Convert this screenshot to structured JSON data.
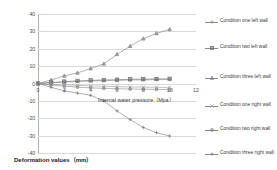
{
  "chart_data": {
    "type": "line",
    "title": "",
    "xlabel": "Internal water pressure（Mpa）",
    "ylabel": "Deformation values（mm）",
    "xlim": [
      0,
      12
    ],
    "ylim": [
      -40,
      40
    ],
    "xticks": [
      "0",
      "2",
      "4",
      "6",
      "8",
      "10",
      "12"
    ],
    "yticks": [
      "40",
      "30",
      "20",
      "10",
      "0",
      "-10",
      "-20",
      "-30",
      "-40"
    ],
    "grid": true,
    "legend_position": "right",
    "x": [
      0,
      1,
      2,
      3,
      4,
      5,
      6,
      7,
      8,
      9,
      10
    ],
    "series": [
      {
        "name": "Condition one left wall",
        "marker": "cross",
        "color": "#8a8a8a",
        "values": [
          0.0,
          0.4,
          0.8,
          1.1,
          1.4,
          1.6,
          1.8,
          2.0,
          2.1,
          2.2,
          2.3
        ]
      },
      {
        "name": "Condition two left wall",
        "marker": "square",
        "color": "#6f6f6f",
        "values": [
          0.0,
          0.6,
          1.1,
          1.5,
          1.8,
          2.0,
          2.2,
          2.4,
          2.5,
          2.6,
          2.7
        ]
      },
      {
        "name": "Condition three left wall",
        "marker": "triangle",
        "color": "#7d7d7d",
        "values": [
          0.0,
          2.0,
          4.4,
          6.1,
          8.6,
          11.3,
          16.8,
          21.5,
          25.8,
          28.8,
          31.2
        ]
      },
      {
        "name": "Condition one right wall",
        "marker": "x",
        "color": "#9a9a9a",
        "values": [
          0.0,
          -0.4,
          -0.8,
          -1.1,
          -1.4,
          -1.6,
          -1.8,
          -2.0,
          -2.1,
          -2.2,
          -2.3
        ]
      },
      {
        "name": "Condition two right wall",
        "marker": "dot",
        "color": "#8a8a8a",
        "values": [
          0.0,
          -0.9,
          -1.6,
          -2.1,
          -2.5,
          -2.8,
          -3.0,
          -3.2,
          -3.3,
          -3.4,
          -3.5
        ]
      },
      {
        "name": "Condition three right wall",
        "marker": "plus",
        "color": "#7a7a7a",
        "values": [
          0.0,
          -2.2,
          -4.2,
          -5.5,
          -6.8,
          -10.0,
          -15.8,
          -20.8,
          -25.3,
          -28.3,
          -30.2
        ]
      }
    ]
  },
  "legend": {
    "items": [
      {
        "label": "Condition one left wall"
      },
      {
        "label": "Condition two left wall"
      },
      {
        "label": "Condition three left wall"
      },
      {
        "label": "Condition one right wall"
      },
      {
        "label": "Condition two right wall"
      },
      {
        "label": "Condition three right wall"
      }
    ]
  }
}
